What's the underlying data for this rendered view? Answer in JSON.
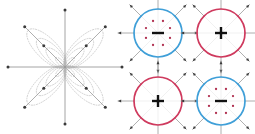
{
  "figure": {
    "title": "",
    "background": "#ffffff",
    "width": 255,
    "height": 134
  },
  "colors": {
    "blue": "#3f9fd8",
    "red": "#cf3a5e",
    "axis_gray": "#9a9a9a",
    "contour_gray": "#b8b8b8",
    "marker_dark": "#3a3a3a",
    "dot_red": "#b03050",
    "background": "#ffffff"
  },
  "chart_data": {
    "type": "diagram",
    "title": "",
    "panels": [
      {
        "id": "rose-panel",
        "label": "",
        "type": "rose-contour",
        "center": [
          65,
          67
        ],
        "axis_count": 8,
        "axis_half_length": 57,
        "petal_count": 4,
        "petal_angles_deg": [
          45,
          135,
          225,
          315
        ],
        "contour_levels": 4,
        "contour_style": "dotted",
        "contour_color": "#b8b8b8",
        "petal_length": 52,
        "petal_width": 19,
        "lobe_marker_radius": 30,
        "endpoint_markers": true
      },
      {
        "id": "circle-top-left",
        "label": "",
        "type": "circle-symbol",
        "center": [
          158,
          33
        ],
        "radius": 24,
        "ring_color": "#3f9fd8",
        "symbol": "minus",
        "symbol_glyph": "—",
        "inner_dot_count": 8,
        "inner_dot_radius": 13,
        "inner_dot_color": "#b03050",
        "spoke_count": 8,
        "spoke_length": 40,
        "spoke_color": "#9a9a9a",
        "arrowheads": true
      },
      {
        "id": "circle-top-right",
        "label": "",
        "type": "circle-symbol",
        "center": [
          221,
          33
        ],
        "radius": 24,
        "ring_color": "#cf3a5e",
        "symbol": "plus",
        "symbol_glyph": "+",
        "inner_dot_count": 0,
        "inner_dot_radius": 0,
        "inner_dot_color": "#b03050",
        "spoke_count": 8,
        "spoke_length": 40,
        "spoke_color": "#9a9a9a",
        "arrowheads": true
      },
      {
        "id": "circle-bottom-left",
        "label": "",
        "type": "circle-symbol",
        "center": [
          158,
          101
        ],
        "radius": 24,
        "ring_color": "#cf3a5e",
        "symbol": "plus",
        "symbol_glyph": "+",
        "inner_dot_count": 0,
        "inner_dot_radius": 0,
        "inner_dot_color": "#b03050",
        "spoke_count": 8,
        "spoke_length": 40,
        "spoke_color": "#9a9a9a",
        "arrowheads": true
      },
      {
        "id": "circle-bottom-right",
        "label": "",
        "type": "circle-symbol",
        "center": [
          221,
          101
        ],
        "radius": 24,
        "ring_color": "#3f9fd8",
        "symbol": "minus",
        "symbol_glyph": "—",
        "inner_dot_count": 8,
        "inner_dot_radius": 13,
        "inner_dot_color": "#b03050",
        "spoke_count": 8,
        "spoke_length": 40,
        "spoke_color": "#9a9a9a",
        "arrowheads": true
      }
    ]
  }
}
